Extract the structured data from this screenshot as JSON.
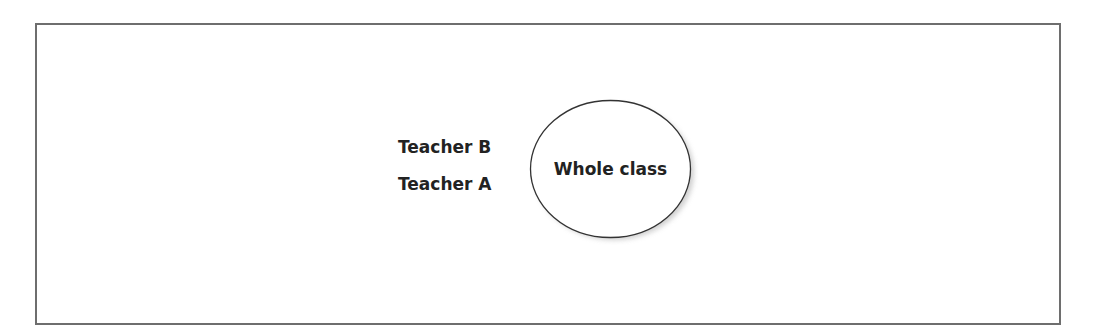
{
  "diagram": {
    "labels": {
      "teacher_b": "Teacher B",
      "teacher_a": "Teacher A"
    },
    "ellipse": {
      "label": "Whole class",
      "fill": "#ffffff",
      "stroke": "#333333",
      "shadow": "#bdbdbd"
    },
    "frame": {
      "stroke": "#6e6e6e"
    }
  }
}
